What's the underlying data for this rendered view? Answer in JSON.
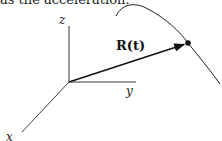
{
  "caption": "as the acceleration.",
  "diagram": {
    "axes": {
      "x_label": "x",
      "y_label": "y",
      "z_label": "z"
    },
    "vector_label": "R(t)"
  }
}
